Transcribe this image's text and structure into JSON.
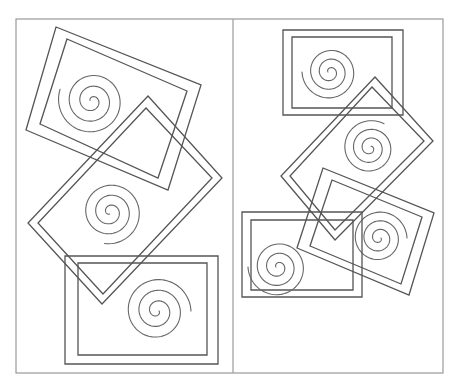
{
  "figure": {
    "width": 460,
    "height": 388,
    "colors": {
      "background": "#ffffff",
      "frame": "#9a9a9a",
      "shape_stroke": "#555555",
      "spiral_stroke": "#666666"
    },
    "frame": {
      "x": 16,
      "y": 19,
      "width": 427,
      "height": 354,
      "divider_x": 233
    },
    "panels": [
      {
        "id": "left",
        "items": [
          {
            "name": "left-top-tilted-frame",
            "outer": [
              [
                56,
                27
              ],
              [
                201,
                85
              ],
              [
                168,
                190
              ],
              [
                26,
                130
              ]
            ],
            "inner": [
              [
                67,
                39
              ],
              [
                187,
                91
              ],
              [
                158,
                178
              ],
              [
                40,
                124
              ]
            ],
            "spiral": {
              "cx": 92,
              "cy": 101,
              "r": 34,
              "turns": 3,
              "start_angle": 200
            }
          },
          {
            "name": "left-middle-diamond-frame",
            "outer": [
              [
                148,
                96
              ],
              [
                222,
                178
              ],
              [
                102,
                304
              ],
              [
                28,
                223
              ]
            ],
            "inner": [
              [
                146,
                108
              ],
              [
                212,
                178
              ],
              [
                103,
                294
              ],
              [
                38,
                223
              ]
            ],
            "spiral": {
              "cx": 110,
              "cy": 212,
              "r": 32,
              "turns": 3,
              "start_angle": 100
            }
          },
          {
            "name": "left-bottom-upright-frame",
            "outer": [
              [
                65,
                256
              ],
              [
                218,
                256
              ],
              [
                218,
                364
              ],
              [
                65,
                364
              ]
            ],
            "inner": [
              [
                78,
                263
              ],
              [
                207,
                263
              ],
              [
                207,
                355
              ],
              [
                78,
                355
              ]
            ],
            "spiral": {
              "cx": 157,
              "cy": 311,
              "r": 34,
              "turns": 3,
              "start_angle": 0
            }
          }
        ]
      },
      {
        "id": "right",
        "items": [
          {
            "name": "right-top-upright-frame",
            "outer": [
              [
                283,
                30
              ],
              [
                403,
                30
              ],
              [
                403,
                115
              ],
              [
                283,
                115
              ]
            ],
            "inner": [
              [
                292,
                37
              ],
              [
                392,
                37
              ],
              [
                392,
                108
              ],
              [
                292,
                108
              ]
            ],
            "spiral": {
              "cx": 330,
              "cy": 72,
              "r": 28,
              "turns": 3,
              "start_angle": 180
            }
          },
          {
            "name": "right-middle-diamond-frame",
            "outer": [
              [
                375,
                77
              ],
              [
                433,
                141
              ],
              [
                335,
                240
              ],
              [
                281,
                176
              ]
            ],
            "inner": [
              [
                372,
                87
              ],
              [
                424,
                141
              ],
              [
                335,
                230
              ],
              [
                290,
                176
              ]
            ],
            "spiral": {
              "cx": 370,
              "cy": 148,
              "r": 28,
              "turns": 3,
              "start_angle": 300
            }
          },
          {
            "name": "right-lower-tilted-frame",
            "outer": [
              [
                323,
                168
              ],
              [
                434,
                213
              ],
              [
                409,
                295
              ],
              [
                297,
                248
              ]
            ],
            "inner": [
              [
                332,
                180
              ],
              [
                422,
                217
              ],
              [
                401,
                284
              ],
              [
                310,
                246
              ]
            ],
            "spiral": {
              "cx": 379,
              "cy": 238,
              "r": 28,
              "turns": 3,
              "start_angle": 0
            }
          },
          {
            "name": "right-bottom-upright-frame",
            "outer": [
              [
                242,
                212
              ],
              [
                362,
                212
              ],
              [
                362,
                297
              ],
              [
                242,
                297
              ]
            ],
            "inner": [
              [
                251,
                220
              ],
              [
                353,
                220
              ],
              [
                353,
                290
              ],
              [
                251,
                290
              ]
            ],
            "spiral": {
              "cx": 278,
              "cy": 267,
              "r": 30,
              "turns": 3,
              "start_angle": 180
            }
          }
        ]
      }
    ]
  }
}
